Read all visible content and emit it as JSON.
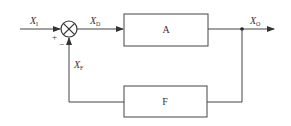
{
  "diagram": {
    "type": "feedback-block-diagram",
    "colors": {
      "line": "#444444",
      "text": "#333333",
      "background": "#ffffff"
    },
    "summing_junction": {
      "symbol": "⊗",
      "input_sign_plus": "+",
      "feedback_sign_minus": "−"
    },
    "blocks": {
      "forward": {
        "label": "A"
      },
      "feedback": {
        "label": "F"
      }
    },
    "signals": {
      "input": {
        "base": "X",
        "sub": "I"
      },
      "difference": {
        "base": "X",
        "sub": "D"
      },
      "output": {
        "base": "X",
        "sub": "O"
      },
      "feedback": {
        "base": "X",
        "sub": "F"
      }
    }
  }
}
